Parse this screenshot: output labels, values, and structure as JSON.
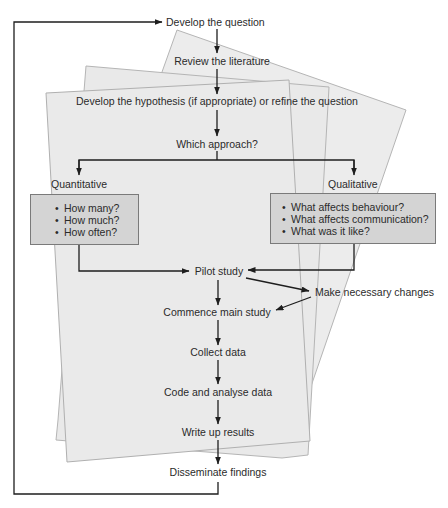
{
  "diagram": {
    "type": "research-process-flowchart",
    "steps": {
      "develop_question": "Develop the question",
      "review_literature": "Review the literature",
      "develop_hypothesis": "Develop the hypothesis (if appropriate) or refine the question",
      "which_approach": "Which approach?",
      "pilot_study": "Pilot study",
      "make_changes": "Make necessary changes",
      "commence_main": "Commence main study",
      "collect_data": "Collect data",
      "code_analyse": "Code and analyse data",
      "write_up": "Write up results",
      "disseminate": "Disseminate findings"
    },
    "branches": {
      "quantitative": {
        "label": "Quantitative",
        "questions": [
          "How many?",
          "How much?",
          "How often?"
        ]
      },
      "qualitative": {
        "label": "Qualitative",
        "questions": [
          "What affects behaviour?",
          "What affects communication?",
          "What was it like?"
        ]
      }
    },
    "colors": {
      "paper_fill": "#ececec",
      "paper_stroke": "#b5b5b5",
      "box_fill": "#d4d4d4",
      "box_stroke": "#7a7a7a",
      "arrow": "#1e1e1e"
    }
  }
}
